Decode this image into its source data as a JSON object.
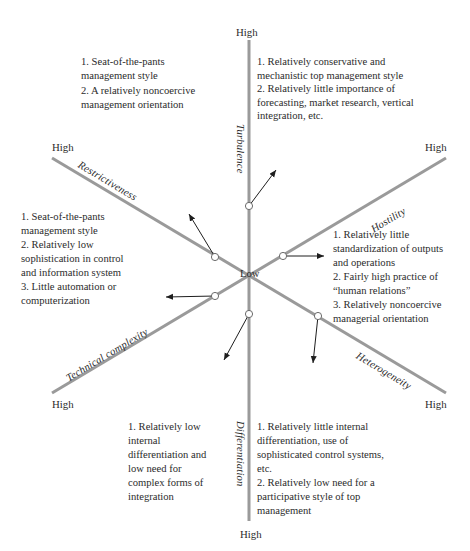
{
  "diagram": {
    "center_label": "Low",
    "axes": [
      {
        "name": "Turbulence",
        "end_label": "High",
        "direction": "up"
      },
      {
        "name": "Hostility",
        "end_label": "High",
        "direction": "upper-right"
      },
      {
        "name": "Heterogeneity",
        "end_label": "High",
        "direction": "lower-right"
      },
      {
        "name": "Differentiation",
        "end_label": "High",
        "direction": "down"
      },
      {
        "name": "Technical complexity",
        "end_label": "High",
        "direction": "lower-left"
      },
      {
        "name": "Restrictiveness",
        "end_label": "High",
        "direction": "upper-left"
      }
    ],
    "blocks": {
      "top_left": [
        "1.  Seat-of-the-pants management style",
        "2.  A relatively noncoercive management orientation"
      ],
      "top_right": [
        "1.  Relatively conservative and mechanistic top management style",
        "2.  Relatively little importance of forecasting, market research, vertical integration, etc."
      ],
      "left": [
        "1.  Seat-of-the-pants management style",
        "2.  Relatively low sophistication in control and information system",
        "3.  Little automation or computerization"
      ],
      "right": [
        "1.  Relatively little standardization of outputs and operations",
        "2.  Fairly high practice of “human relations”",
        "3.  Relatively noncoercive managerial orientation"
      ],
      "bottom_left": [
        "1.  Relatively low internal differentiation and low need for complex forms of integration"
      ],
      "bottom_right": [
        "1.  Relatively little internal differentiation, use of sophisticated control systems, etc.",
        "2.  Relatively low need for a participative style of top management"
      ]
    },
    "colors": {
      "axis": "#9a9a9a",
      "arrow": "#1e1e1e",
      "text": "#2b2b2b"
    }
  }
}
